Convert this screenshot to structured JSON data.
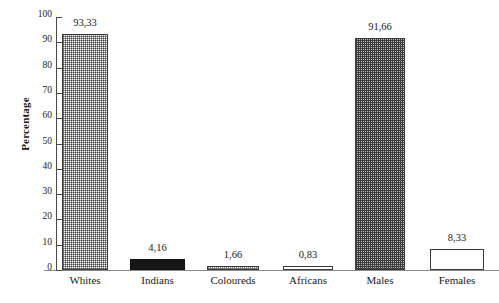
{
  "chart_data": {
    "type": "bar",
    "title": "",
    "xlabel": "",
    "ylabel": "Percentage",
    "ylim": [
      0,
      100
    ],
    "ytick_step": 10,
    "yticks": [
      100,
      90,
      80,
      70,
      60,
      50,
      40,
      30,
      20,
      10,
      0
    ],
    "ytick_labels": [
      "100",
      "90",
      "80",
      "70",
      "60",
      "50",
      "40",
      "30",
      "20",
      "10",
      "0"
    ],
    "grid": false,
    "legend": "none",
    "decimal_separator": ",",
    "categories": [
      "Whites",
      "Indians",
      "Coloureds",
      "Africans",
      "Males",
      "Females"
    ],
    "values": [
      93.33,
      4.16,
      1.66,
      0.83,
      91.66,
      8.33
    ],
    "value_labels": [
      "93,33",
      "4,16",
      "1,66",
      "0,83",
      "91,66",
      "8,33"
    ],
    "bars": [
      {
        "category": "Whites",
        "value": 93.33,
        "label": "93,33",
        "fill": "checker-light",
        "fill_color": "#c9c9c9",
        "border_color": "#3a3a3a"
      },
      {
        "category": "Indians",
        "value": 4.16,
        "label": "4,16",
        "fill": "solid-black",
        "fill_color": "#171717",
        "border_color": "#111111"
      },
      {
        "category": "Coloureds",
        "value": 1.66,
        "label": "1,66",
        "fill": "dotted",
        "fill_color": "#d8d8d8",
        "border_color": "#3a3a3a"
      },
      {
        "category": "Africans",
        "value": 0.83,
        "label": "0,83",
        "fill": "empty",
        "fill_color": "#ffffff",
        "border_color": "#3a3a3a"
      },
      {
        "category": "Males",
        "value": 91.66,
        "label": "91,66",
        "fill": "checker-dark",
        "fill_color": "#8a8a8a",
        "border_color": "#3a3a3a"
      },
      {
        "category": "Females",
        "value": 8.33,
        "label": "8,33",
        "fill": "empty",
        "fill_color": "#ffffff",
        "border_color": "#3a3a3a"
      }
    ]
  },
  "axis": {
    "y_title": "Percentage",
    "axis_color": "#4a4a4a",
    "baseline_color": "#8a8a8a"
  }
}
